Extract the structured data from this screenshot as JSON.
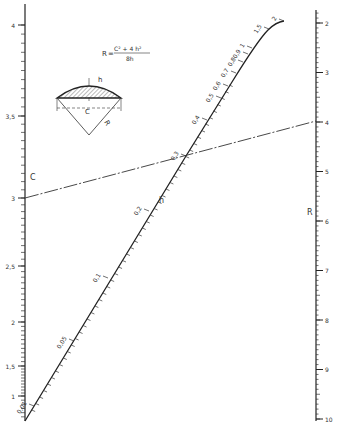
{
  "figure": {
    "type": "nomogram",
    "formula": {
      "lhs": "R",
      "numerator": "C² + 4 h²",
      "denominator": "8h"
    },
    "sketch": {
      "labels": {
        "h": "h",
        "c": "C",
        "r": "R"
      }
    }
  },
  "scales": {
    "c": {
      "name": "C",
      "ticks": [
        {
          "label": "4",
          "value": 4
        },
        {
          "label": "3,5",
          "value": 3.5
        },
        {
          "label": "3",
          "value": 3
        },
        {
          "label": "2,5",
          "value": 2.5
        },
        {
          "label": "2",
          "value": 2
        },
        {
          "label": "1,5",
          "value": 1.5
        },
        {
          "label": "1",
          "value": 1
        }
      ]
    },
    "r": {
      "name": "R",
      "ticks": [
        {
          "label": "2",
          "value": 2
        },
        {
          "label": "3",
          "value": 3
        },
        {
          "label": "4",
          "value": 4
        },
        {
          "label": "5",
          "value": 5
        },
        {
          "label": "6",
          "value": 6
        },
        {
          "label": "7",
          "value": 7
        },
        {
          "label": "8",
          "value": 8
        },
        {
          "label": "9",
          "value": 9
        },
        {
          "label": "10",
          "value": 10
        }
      ]
    },
    "h": {
      "name": "h",
      "ticks": [
        {
          "label": "0,01",
          "value": 0.01
        },
        {
          "label": "0,05",
          "value": 0.05
        },
        {
          "label": "0,1",
          "value": 0.1
        },
        {
          "label": "0,2",
          "value": 0.2
        },
        {
          "label": "0,3",
          "value": 0.3
        },
        {
          "label": "0,4",
          "value": 0.4
        },
        {
          "label": "0,5",
          "value": 0.5
        },
        {
          "label": "0,6",
          "value": 0.6
        },
        {
          "label": "0,7",
          "value": 0.7
        },
        {
          "label": "0,8",
          "value": 0.8
        },
        {
          "label": "0,9",
          "value": 0.9
        },
        {
          "label": "1",
          "value": 1
        },
        {
          "label": "1,5",
          "value": 1.5
        },
        {
          "label": "2",
          "value": 2
        }
      ]
    }
  },
  "index_line": {
    "c": 3,
    "h": 0.3,
    "r": 4
  }
}
